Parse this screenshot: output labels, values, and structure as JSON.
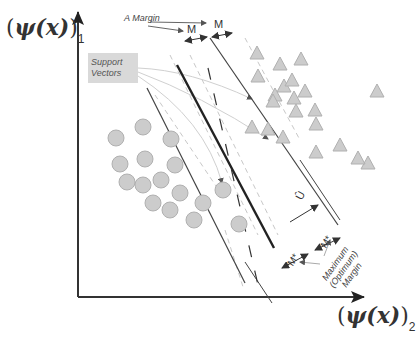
{
  "diagram": {
    "title": "",
    "axes": {
      "y_label": {
        "open": "(",
        "symbol": "ψ(x)",
        "close": ")",
        "subscript": "1"
      },
      "x_label": {
        "open": "(",
        "symbol": "ψ(x)",
        "close": ")",
        "subscript": "2"
      }
    },
    "annotations": {
      "a_margin": "A Margin",
      "m_left": "M",
      "m_right": "M",
      "support_vectors_line1": "Support",
      "support_vectors_line2": "Vectors",
      "m_star_left": "M*",
      "m_star_right": "M*",
      "u_hat": "Û",
      "max_margin_line1": "Maximum",
      "max_margin_line2": "(Optimum)",
      "max_margin_line3": "Margin"
    },
    "colors": {
      "axis": "#333333",
      "hyperplane": "#222222",
      "margin_line": "#444444",
      "dashed_line": "#333333",
      "guide": "#bbbbbb",
      "point_fill": "#cccccc",
      "point_stroke": "#b0b0b0",
      "label_box": "#d9d9d9"
    },
    "classes": [
      {
        "name": "circles",
        "shape": "circle",
        "count": 18
      },
      {
        "name": "triangles",
        "shape": "triangle",
        "count": 22
      }
    ],
    "circles": [
      [
        116,
        138
      ],
      [
        143,
        127
      ],
      [
        171,
        139
      ],
      [
        120,
        164
      ],
      [
        145,
        159
      ],
      [
        175,
        165
      ],
      [
        127,
        182
      ],
      [
        143,
        185
      ],
      [
        161,
        180
      ],
      [
        180,
        193
      ],
      [
        153,
        203
      ],
      [
        170,
        210
      ],
      [
        203,
        203
      ],
      [
        194,
        220
      ],
      [
        223,
        190
      ],
      [
        239,
        224
      ]
    ],
    "triangles": [
      [
        257,
        53
      ],
      [
        280,
        64
      ],
      [
        301,
        59
      ],
      [
        258,
        76
      ],
      [
        284,
        86
      ],
      [
        292,
        80
      ],
      [
        305,
        91
      ],
      [
        275,
        95
      ],
      [
        294,
        98
      ],
      [
        273,
        101
      ],
      [
        315,
        110
      ],
      [
        296,
        111
      ],
      [
        316,
        124
      ],
      [
        252,
        127
      ],
      [
        268,
        129
      ],
      [
        283,
        137
      ],
      [
        316,
        152
      ],
      [
        340,
        145
      ],
      [
        377,
        91
      ],
      [
        368,
        163
      ],
      [
        358,
        158
      ]
    ]
  }
}
